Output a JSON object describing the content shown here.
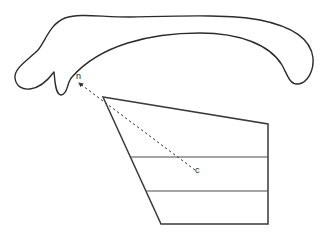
{
  "diagram": {
    "labels": {
      "point_n": "n",
      "point_c": "c"
    },
    "colors": {
      "stroke": "#2b2b2b",
      "background": "#ffffff"
    },
    "shapes": {
      "curved_outline": "elongated hook-shaped outline (upper shape)",
      "quadrilateral": "four-sided polygon divided by two horizontal lines into three bands",
      "arrow": "dashed arrow from point c to point n"
    }
  }
}
